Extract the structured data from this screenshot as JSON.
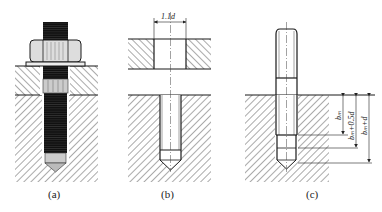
{
  "figure": {
    "panels": [
      {
        "id": "a",
        "caption": "(a)",
        "description": "bolt with nut and washer threaded into tapped hole through two plates"
      },
      {
        "id": "b",
        "caption": "(b)",
        "description": "clearance hole in top plate and tapped blind hole in base",
        "dimension": "1.1d"
      },
      {
        "id": "c",
        "caption": "(c)",
        "description": "stud screwed into tapped blind hole",
        "dimensions": [
          "bₘ",
          "bₘ+0.5d",
          "bₘ+d"
        ]
      }
    ],
    "colors": {
      "line": "#1a1a1a",
      "hatch": "#555555",
      "background": "#ffffff"
    }
  }
}
